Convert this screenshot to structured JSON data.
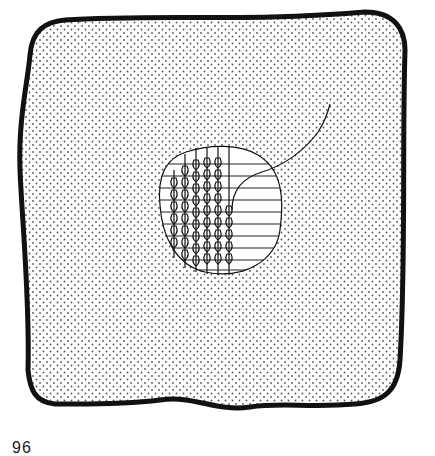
{
  "figure": {
    "number": "96",
    "colors": {
      "outline": "#111111",
      "fabric_dot": "#555555",
      "background": "#ffffff",
      "hole_fill": "#ffffff"
    },
    "parts": {
      "fabric": "stippled-fabric-piece",
      "hole": "oval-hole",
      "warp_threads": "horizontal-laid-threads",
      "stitched_columns": 6,
      "horizontal_threads": 11,
      "loose_thread": "working-thread-tail"
    }
  }
}
